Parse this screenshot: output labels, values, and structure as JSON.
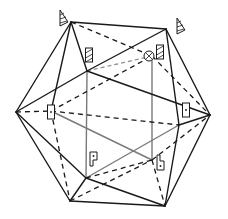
{
  "diagram": {
    "title": "",
    "colors": {
      "edge": "#1a1a1a",
      "inner_frame": "#7a7a7a",
      "background": "#ffffff"
    },
    "vertices": {
      "A": [
        71,
        22
      ],
      "B": [
        166,
        29
      ],
      "C": [
        16,
        112
      ],
      "D": [
        210,
        115
      ],
      "E": [
        87,
        71
      ],
      "F": [
        152,
        56
      ],
      "G": [
        86,
        178
      ],
      "H": [
        179,
        125
      ],
      "I": [
        70,
        201
      ],
      "J": [
        165,
        206
      ],
      "K": [
        152,
        160
      ],
      "P": [
        51,
        111
      ]
    },
    "solid_edges": [
      [
        "A",
        "B"
      ],
      [
        "A",
        "C"
      ],
      [
        "A",
        "E"
      ],
      [
        "E",
        "B"
      ],
      [
        "B",
        "D"
      ],
      [
        "B",
        "H"
      ],
      [
        "C",
        "E"
      ],
      [
        "E",
        "D"
      ],
      [
        "C",
        "I"
      ],
      [
        "C",
        "G"
      ],
      [
        "G",
        "I"
      ],
      [
        "G",
        "J"
      ],
      [
        "I",
        "J"
      ],
      [
        "H",
        "J"
      ],
      [
        "D",
        "J"
      ],
      [
        "D",
        "H"
      ],
      [
        "A",
        "P"
      ]
    ],
    "dashed_edges": [
      [
        "A",
        "F"
      ],
      [
        "C",
        "P"
      ],
      [
        "P",
        "F"
      ],
      [
        "F",
        "D"
      ],
      [
        "P",
        "I"
      ],
      [
        "P",
        "H"
      ],
      [
        "G",
        "K"
      ],
      [
        "K",
        "J"
      ],
      [
        "K",
        "D"
      ],
      [
        "I",
        "K"
      ]
    ],
    "gray_edges": [
      [
        "E",
        "G"
      ],
      [
        "F",
        "K"
      ],
      [
        "G",
        "H"
      ],
      [
        "P",
        "K"
      ]
    ],
    "gray_dashed_edges": [
      [
        "E",
        "F"
      ]
    ],
    "symbols": [
      {
        "type": "triangle-hatched",
        "name": "3-fold-axis-top-left",
        "x": 60,
        "y": 18
      },
      {
        "type": "triangle-hatched",
        "name": "3-fold-axis-top-right",
        "x": 177,
        "y": 26
      },
      {
        "type": "rectangle-hatched",
        "name": "2-fold-axis-upper-left",
        "x": 89,
        "y": 55
      },
      {
        "type": "rectangle-hatched",
        "name": "2-fold-axis-upper-right",
        "x": 160,
        "y": 52
      },
      {
        "type": "circle-cross",
        "name": "5-fold-axis-center",
        "x": 149,
        "y": 56
      },
      {
        "type": "rectangle-dot",
        "name": "2-fold-axis-left",
        "x": 51,
        "y": 112
      },
      {
        "type": "rectangle-dot",
        "name": "2-fold-axis-right",
        "x": 186,
        "y": 110
      },
      {
        "type": "p-shape-dot",
        "name": "2-fold-axis-lower-left",
        "x": 93,
        "y": 160
      },
      {
        "type": "b-shape-dot",
        "name": "2-fold-axis-lower-right",
        "x": 160,
        "y": 163
      }
    ]
  }
}
